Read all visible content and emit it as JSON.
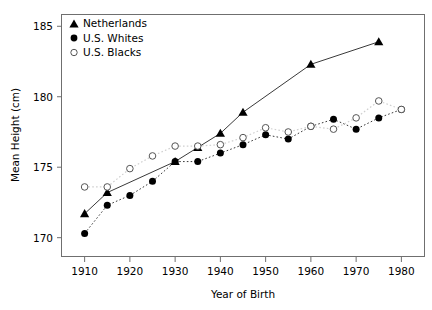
{
  "chart_data": {
    "type": "line",
    "title": "",
    "xlabel": "Year of Birth",
    "ylabel": "Mean Height (cm)",
    "xlim": [
      1905,
      1985
    ],
    "ylim": [
      168.7,
      185.8
    ],
    "xticks": [
      1910,
      1920,
      1930,
      1940,
      1950,
      1960,
      1970,
      1980
    ],
    "yticks": [
      170,
      175,
      180,
      185
    ],
    "grid": false,
    "legend_position": "top-left",
    "series": [
      {
        "name": "Netherlands",
        "marker": "filled-triangle",
        "line_style": "solid",
        "color": "#000000",
        "x": [
          1910,
          1915,
          1930,
          1935,
          1940,
          1945,
          1960,
          1975
        ],
        "y": [
          171.7,
          173.2,
          175.4,
          176.4,
          177.4,
          178.9,
          182.3,
          183.9
        ]
      },
      {
        "name": "U.S. Whites",
        "marker": "filled-circle",
        "line_style": "dotted",
        "color": "#000000",
        "x": [
          1910,
          1915,
          1920,
          1925,
          1930,
          1935,
          1940,
          1945,
          1950,
          1955,
          1960,
          1965,
          1970,
          1975,
          1980
        ],
        "y": [
          170.3,
          172.3,
          173.0,
          174.0,
          175.4,
          175.4,
          176.0,
          176.6,
          177.3,
          177.0,
          177.9,
          178.4,
          177.7,
          178.5,
          179.1
        ],
        "line_x": [
          1910,
          1915,
          1920,
          1925,
          1930,
          1935,
          1940,
          1945,
          1950,
          1955,
          1960,
          1965,
          1970,
          1975,
          1980
        ]
      },
      {
        "name": "U.S. Blacks",
        "marker": "open-circle",
        "line_style": "dotted-light",
        "color": "#000000",
        "x": [
          1910,
          1915,
          1920,
          1925,
          1930,
          1935,
          1940,
          1945,
          1950,
          1955,
          1960,
          1965,
          1970,
          1975,
          1980
        ],
        "y": [
          173.6,
          173.6,
          174.9,
          175.8,
          176.5,
          176.5,
          176.6,
          177.1,
          177.8,
          177.5,
          177.9,
          177.7,
          178.5,
          179.7,
          179.1
        ]
      }
    ]
  },
  "legend": {
    "items": [
      {
        "label": "Netherlands",
        "marker": "filled-triangle"
      },
      {
        "label": "U.S. Whites",
        "marker": "filled-circle"
      },
      {
        "label": "U.S. Blacks",
        "marker": "open-circle"
      }
    ]
  },
  "axes": {
    "y_title": "Mean Height (cm)",
    "x_title": "Year of Birth",
    "y_tick_labels": [
      "185",
      "180",
      "175",
      "170"
    ],
    "x_tick_labels": [
      "1910",
      "1920",
      "1930",
      "1940",
      "1950",
      "1960",
      "1970",
      "1980"
    ]
  },
  "colors": {
    "frame": "#6f6f6f",
    "series_dark": "#000000",
    "series_light": "#d9d9d9",
    "background": "#ffffff"
  }
}
